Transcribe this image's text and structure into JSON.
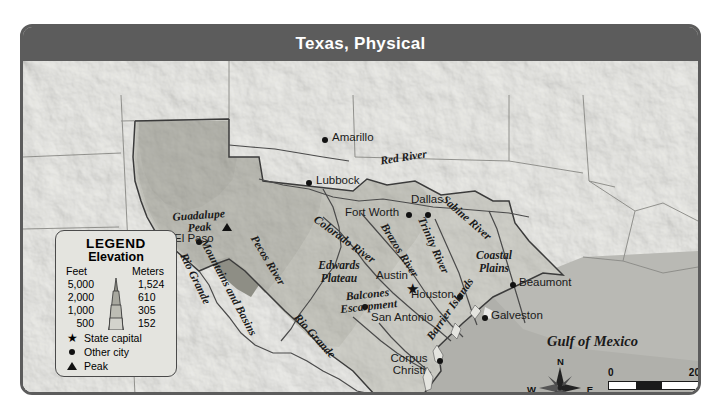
{
  "map": {
    "title": "Texas, Physical",
    "ocean_label": "Gulf of Mexico",
    "cities": [
      {
        "name": "Amarillo",
        "type": "other-city",
        "x": 306,
        "y": 112
      },
      {
        "name": "Lubbock",
        "type": "other-city",
        "x": 291,
        "y": 155
      },
      {
        "name": "El Paso",
        "type": "other-city",
        "x": 176,
        "y": 216
      },
      {
        "name": "Fort Worth",
        "type": "other-city",
        "x": 388,
        "y": 187
      },
      {
        "name": "Dallas",
        "type": "other-city",
        "x": 423,
        "y": 181
      },
      {
        "name": "Austin",
        "type": "state-capital",
        "x": 396,
        "y": 255
      },
      {
        "name": "Houston",
        "type": "other-city",
        "x": 440,
        "y": 270
      },
      {
        "name": "San Antonio",
        "type": "other-city",
        "x": 378,
        "y": 288
      },
      {
        "name": "Beaumont",
        "type": "other-city",
        "x": 497,
        "y": 258
      },
      {
        "name": "Galveston",
        "type": "other-city",
        "x": 472,
        "y": 291
      },
      {
        "name": "Corpus Christi",
        "type": "other-city",
        "x": 396,
        "y": 341
      },
      {
        "name": "Guadalupe Peak",
        "type": "peak",
        "x": 200,
        "y": 197
      }
    ],
    "physical_features": [
      {
        "name": "Mountains and Basins",
        "x": 215,
        "y": 208
      },
      {
        "name": "Edwards Plateau",
        "x": 312,
        "y": 239
      },
      {
        "name": "Balcones Escarpment",
        "x": 345,
        "y": 268
      },
      {
        "name": "Coastal Plains",
        "x": 470,
        "y": 228
      },
      {
        "name": "Barrier Islands",
        "x": 422,
        "y": 320
      }
    ],
    "water_features": [
      {
        "name": "Red River",
        "x": 396,
        "y": 133
      },
      {
        "name": "Pecos River",
        "x": 264,
        "y": 214
      },
      {
        "name": "Colorado River",
        "x": 328,
        "y": 199
      },
      {
        "name": "Brazos River",
        "x": 401,
        "y": 207
      },
      {
        "name": "Trinity River",
        "x": 434,
        "y": 200
      },
      {
        "name": "Sabine River",
        "x": 447,
        "y": 176
      },
      {
        "name": "Rio Grande",
        "x": 188,
        "y": 236
      },
      {
        "name": "Rio Grande",
        "x": 310,
        "y": 300
      }
    ]
  },
  "legend": {
    "title": "LEGEND",
    "subtitle": "Elevation",
    "col_feet": "Feet",
    "col_meters": "Meters",
    "rows": [
      {
        "feet": "5,000",
        "meters": "1,524"
      },
      {
        "feet": "2,000",
        "meters": "610"
      },
      {
        "feet": "1,000",
        "meters": "305"
      },
      {
        "feet": "500",
        "meters": "152"
      }
    ],
    "keys": [
      {
        "symbol": "star-icon",
        "label": "State capital"
      },
      {
        "symbol": "dot-icon",
        "label": "Other city"
      },
      {
        "symbol": "triangle-icon",
        "label": "Peak"
      }
    ]
  },
  "compass": {
    "north": "N",
    "south": "S",
    "east": "E",
    "west": "W"
  },
  "scale": {
    "miles_zero": "0",
    "miles_max": "200 mi",
    "km_zero": "0",
    "km_max": "200 km"
  },
  "colors": {
    "frame": "#5c5c5c",
    "title_bar": "#5c5c5c",
    "title_text": "#ffffff",
    "ocean": "#b9b9b4",
    "land_outside": "#ededea",
    "elev_lowest": "#d3d3cc",
    "elev_low": "#bdbdb4",
    "elev_mid": "#a8a89f",
    "elev_high": "#8e8e85",
    "legend_bg": "#e4e4df",
    "marker": "#111111"
  }
}
